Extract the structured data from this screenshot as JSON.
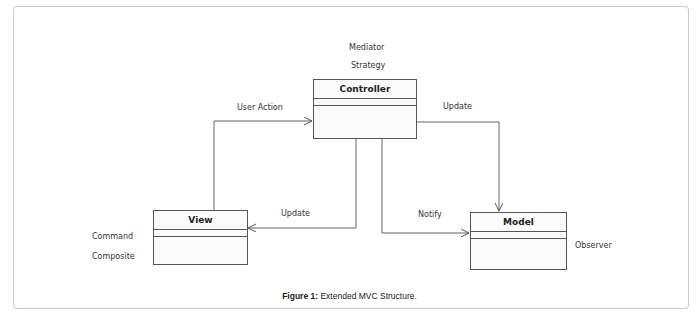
{
  "diagram": {
    "classes": {
      "controller": {
        "name": "Controller",
        "patterns": [
          "Mediator",
          "Strategy"
        ]
      },
      "view": {
        "name": "View",
        "patterns": [
          "Command",
          "Composite"
        ]
      },
      "model": {
        "name": "Model",
        "patterns": [
          "Observer"
        ]
      }
    },
    "edges": [
      {
        "from": "View",
        "to": "Controller",
        "label": "User Action"
      },
      {
        "from": "Controller",
        "to": "Model",
        "label": "Update"
      },
      {
        "from": "Controller",
        "to": "View",
        "label": "Update"
      },
      {
        "from": "Controller",
        "to": "Model",
        "label": "Notify"
      }
    ],
    "line_color": "#555555"
  },
  "caption": {
    "label": "Figure 1:",
    "text": " Extended MVC Structure."
  }
}
